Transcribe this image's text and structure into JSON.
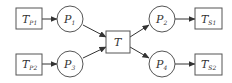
{
  "diagram": {
    "type": "petri-net",
    "colors": {
      "stroke": "#555555",
      "text": "#333333",
      "background": "#ffffff"
    },
    "nodes": {
      "tp1": {
        "kind": "transition",
        "label": "T",
        "sub": "P1"
      },
      "tp2": {
        "kind": "transition",
        "label": "T",
        "sub": "P2"
      },
      "p1": {
        "kind": "place",
        "label": "P",
        "sub": "1"
      },
      "p3": {
        "kind": "place",
        "label": "P",
        "sub": "3"
      },
      "t": {
        "kind": "transition",
        "label": "T",
        "sub": ""
      },
      "p2": {
        "kind": "place",
        "label": "P",
        "sub": "2"
      },
      "p4": {
        "kind": "place",
        "label": "P",
        "sub": "4"
      },
      "ts1": {
        "kind": "transition",
        "label": "T",
        "sub": "S1"
      },
      "ts2": {
        "kind": "transition",
        "label": "T",
        "sub": "S2"
      }
    },
    "edges": [
      [
        "tp1",
        "p1"
      ],
      [
        "tp2",
        "p3"
      ],
      [
        "p1",
        "t"
      ],
      [
        "p3",
        "t"
      ],
      [
        "t",
        "p2"
      ],
      [
        "t",
        "p4"
      ],
      [
        "p2",
        "ts1"
      ],
      [
        "p4",
        "ts2"
      ]
    ]
  }
}
